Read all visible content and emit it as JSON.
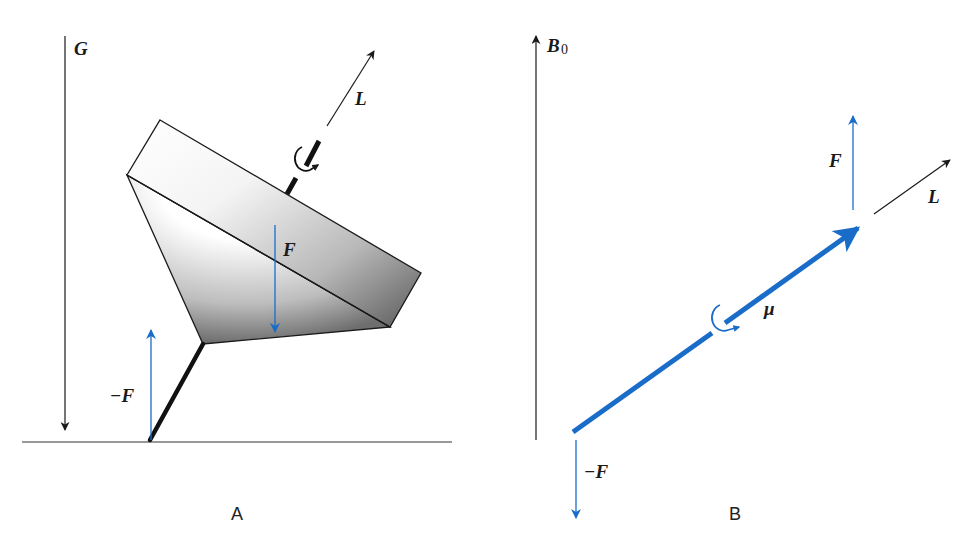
{
  "colors": {
    "blue": "#1a6cc9",
    "black": "#1a1a1a",
    "background": "#ffffff"
  },
  "panel_a": {
    "caption": "A",
    "gravity_label": "G",
    "angular_momentum_label": "L",
    "force_label": "F",
    "reaction_force_label": "−F",
    "objects": [
      "gravity-axis",
      "spinning-top",
      "top-axle",
      "rotation-arrow",
      "ground-line",
      "force-arrow",
      "reaction-force-arrow"
    ]
  },
  "panel_b": {
    "caption": "B",
    "field_label": "B",
    "field_subscript": "0",
    "magnetic_moment_label": "μ",
    "angular_momentum_label": "L",
    "force_label": "F",
    "reaction_force_label": "−F",
    "objects": [
      "field-axis",
      "magnetic-moment-vector",
      "rotation-arrow",
      "force-arrow",
      "reaction-force-arrow",
      "angular-momentum-arrow"
    ]
  }
}
